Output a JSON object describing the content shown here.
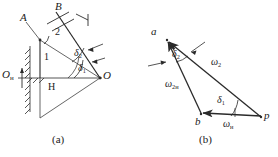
{
  "figure": {
    "panels": [
      {
        "id": "a",
        "caption": "(a)",
        "labels": {
          "point_A": "A",
          "point_B": "B",
          "point_O": "O",
          "point_O_fixed": "O",
          "point_O_fixed_sub": "н",
          "link_1": "1",
          "link_2": "2",
          "point_H": "H",
          "angle_delta_1": "δ",
          "angle_delta_1_sub": "1",
          "angle_delta_2": "δ",
          "angle_delta_2_sub": "2"
        }
      },
      {
        "id": "b",
        "caption": "(b)",
        "labels": {
          "vertex_a": "a",
          "vertex_b": "b",
          "vertex_p": "p",
          "vector_omega_2": "ω",
          "vector_omega_2_sub": "2",
          "vector_omega_2n": "ω",
          "vector_omega_2n_sub": "2н",
          "vector_omega_n": "ω",
          "vector_omega_n_sub": "н",
          "angle_delta_1": "δ",
          "angle_delta_1_sub": "1",
          "angle_delta_2": "δ",
          "angle_delta_2_sub": "2"
        }
      }
    ]
  },
  "style": {
    "stroke": "#1a1a1a",
    "text": "#1a1a1a",
    "background": "#ffffff"
  }
}
